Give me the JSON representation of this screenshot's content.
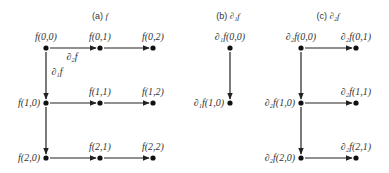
{
  "panels": [
    {
      "id": "a",
      "title": {
        "prefix": "(a) ",
        "symbol": "f",
        "x": 100,
        "y": 19
      },
      "nodes": [
        {
          "key": "0,0",
          "label": "f(0,0)",
          "x": 46,
          "y": 48,
          "lx": 46,
          "ly": 40,
          "anchor": "middle"
        },
        {
          "key": "0,1",
          "label": "f(0,1)",
          "x": 100,
          "y": 48,
          "lx": 100,
          "ly": 40,
          "anchor": "middle"
        },
        {
          "key": "0,2",
          "label": "f(0,2)",
          "x": 153,
          "y": 48,
          "lx": 153,
          "ly": 40,
          "anchor": "middle"
        },
        {
          "key": "1,0",
          "label": "f(1,0)",
          "x": 46,
          "y": 103,
          "lx": 40,
          "ly": 106,
          "anchor": "end"
        },
        {
          "key": "1,1",
          "label": "f(1,1)",
          "x": 100,
          "y": 103,
          "lx": 100,
          "ly": 95,
          "anchor": "middle"
        },
        {
          "key": "1,2",
          "label": "f(1,2)",
          "x": 153,
          "y": 103,
          "lx": 153,
          "ly": 95,
          "anchor": "middle"
        },
        {
          "key": "2,0",
          "label": "f(2,0)",
          "x": 46,
          "y": 158,
          "lx": 40,
          "ly": 161,
          "anchor": "end"
        },
        {
          "key": "2,1",
          "label": "f(2,1)",
          "x": 100,
          "y": 158,
          "lx": 100,
          "ly": 150,
          "anchor": "middle"
        },
        {
          "key": "2,2",
          "label": "f(2,2)",
          "x": 153,
          "y": 158,
          "lx": 153,
          "ly": 150,
          "anchor": "middle"
        }
      ],
      "edges": [
        [
          "0,0",
          "0,1"
        ],
        [
          "0,1",
          "0,2"
        ],
        [
          "1,0",
          "1,1"
        ],
        [
          "1,1",
          "1,2"
        ],
        [
          "2,0",
          "2,1"
        ],
        [
          "2,1",
          "2,2"
        ],
        [
          "0,0",
          "1,0"
        ],
        [
          "1,0",
          "2,0"
        ]
      ],
      "edge_labels": [
        {
          "text": "∂₂f",
          "x": 72,
          "y": 60
        },
        {
          "text": "∂₁f",
          "x": 57,
          "y": 75
        }
      ]
    },
    {
      "id": "b",
      "title": {
        "prefix": "(b) ",
        "symbol": "∂₁f",
        "x": 228,
        "y": 19
      },
      "nodes": [
        {
          "key": "0,0",
          "label": "∂₁f(0,0)",
          "x": 230,
          "y": 48,
          "lx": 230,
          "ly": 40,
          "anchor": "middle"
        },
        {
          "key": "1,0",
          "label": "∂₁f(1,0)",
          "x": 230,
          "y": 103,
          "lx": 224,
          "ly": 106,
          "anchor": "end"
        }
      ],
      "edges": [
        [
          "0,0",
          "1,0"
        ]
      ],
      "edge_labels": []
    },
    {
      "id": "c",
      "title": {
        "prefix": "(c) ",
        "symbol": "∂₂f",
        "x": 328,
        "y": 19
      },
      "nodes": [
        {
          "key": "0,0",
          "label": "∂₂f(0,0)",
          "x": 301,
          "y": 48,
          "lx": 301,
          "ly": 40,
          "anchor": "middle"
        },
        {
          "key": "0,1",
          "label": "∂₂f(0,1)",
          "x": 356,
          "y": 48,
          "lx": 356,
          "ly": 40,
          "anchor": "middle"
        },
        {
          "key": "1,0",
          "label": "∂₂f(1,0)",
          "x": 301,
          "y": 103,
          "lx": 295,
          "ly": 106,
          "anchor": "end"
        },
        {
          "key": "1,1",
          "label": "∂₂f(1,1)",
          "x": 356,
          "y": 103,
          "lx": 356,
          "ly": 95,
          "anchor": "middle"
        },
        {
          "key": "2,0",
          "label": "∂₂f(2,0)",
          "x": 301,
          "y": 158,
          "lx": 295,
          "ly": 161,
          "anchor": "end"
        },
        {
          "key": "2,1",
          "label": "∂₂f(2,1)",
          "x": 356,
          "y": 158,
          "lx": 356,
          "ly": 150,
          "anchor": "middle"
        }
      ],
      "edges": [
        [
          "0,0",
          "0,1"
        ],
        [
          "1,0",
          "1,1"
        ],
        [
          "2,0",
          "2,1"
        ],
        [
          "0,0",
          "1,0"
        ],
        [
          "1,0",
          "2,0"
        ]
      ],
      "edge_labels": []
    }
  ]
}
